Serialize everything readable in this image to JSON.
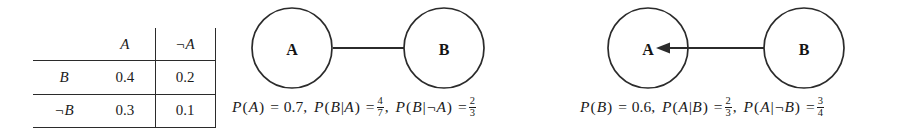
{
  "figure": {
    "type": "joint-distribution-and-bayesian-networks",
    "ink_color": "#2b2b2b"
  },
  "joint_table": {
    "corner": "",
    "column_headers": [
      "A",
      "¬A"
    ],
    "row_headers": [
      "B",
      "¬B"
    ],
    "rows": [
      {
        "label": "B",
        "cells": [
          "0.4",
          "0.2"
        ]
      },
      {
        "label": "¬B",
        "cells": [
          "0.3",
          "0.1"
        ]
      }
    ]
  },
  "graph_ab": {
    "name": "network-a-to-b",
    "nodes": [
      {
        "id": "A",
        "label": "A"
      },
      {
        "id": "B",
        "label": "B"
      }
    ],
    "edge": {
      "from": "A",
      "to": "B",
      "direction": "right"
    }
  },
  "graph_ba": {
    "name": "network-b-to-a",
    "nodes": [
      {
        "id": "A",
        "label": "A"
      },
      {
        "id": "B",
        "label": "B"
      }
    ],
    "edge": {
      "from": "B",
      "to": "A",
      "direction": "left"
    }
  },
  "formula_ab": {
    "term1": {
      "fn": "P",
      "arg": "A",
      "eq": "=",
      "value": "0.7"
    },
    "term2": {
      "fn": "P",
      "arg": "B|A",
      "eq": "=",
      "num": "4",
      "den": "7"
    },
    "term3": {
      "fn": "P",
      "arg": "B|¬A",
      "eq": "=",
      "num": "2",
      "den": "3"
    }
  },
  "formula_ba": {
    "term1": {
      "fn": "P",
      "arg": "B",
      "eq": "=",
      "value": "0.6"
    },
    "term2": {
      "fn": "P",
      "arg": "A|B",
      "eq": "=",
      "num": "2",
      "den": "3"
    },
    "term3": {
      "fn": "P",
      "arg": "A|¬B",
      "eq": "=",
      "num": "3",
      "den": "4"
    }
  },
  "punct": {
    "comma": ",",
    "lparen": "(",
    "rparen": ")"
  }
}
